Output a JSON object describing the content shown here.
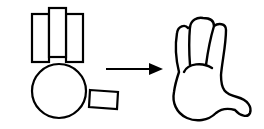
{
  "diagram": {
    "stroke_color": "#000000",
    "fill_color": "#ffffff",
    "background": "#ffffff",
    "source": {
      "label": "primitive-shapes",
      "rectangles": [
        {
          "name": "left-finger-rect",
          "x": 32,
          "y": 14,
          "w": 17,
          "h": 48
        },
        {
          "name": "right-finger-rect",
          "x": 66,
          "y": 14,
          "w": 17,
          "h": 48
        },
        {
          "name": "middle-finger-rect",
          "x": 49,
          "y": 8,
          "w": 17,
          "h": 49
        }
      ],
      "circle": {
        "name": "palm-circle",
        "cx": 59,
        "cy": 91,
        "r": 27
      },
      "thumb_rect": {
        "name": "thumb-rect",
        "points": "90,90 118,92 117,109 89,107"
      }
    },
    "arrow": {
      "label": "transforms-into",
      "x1": 106,
      "y1": 69,
      "x2": 163,
      "y2": 69
    },
    "target": {
      "label": "hand-shape"
    }
  }
}
